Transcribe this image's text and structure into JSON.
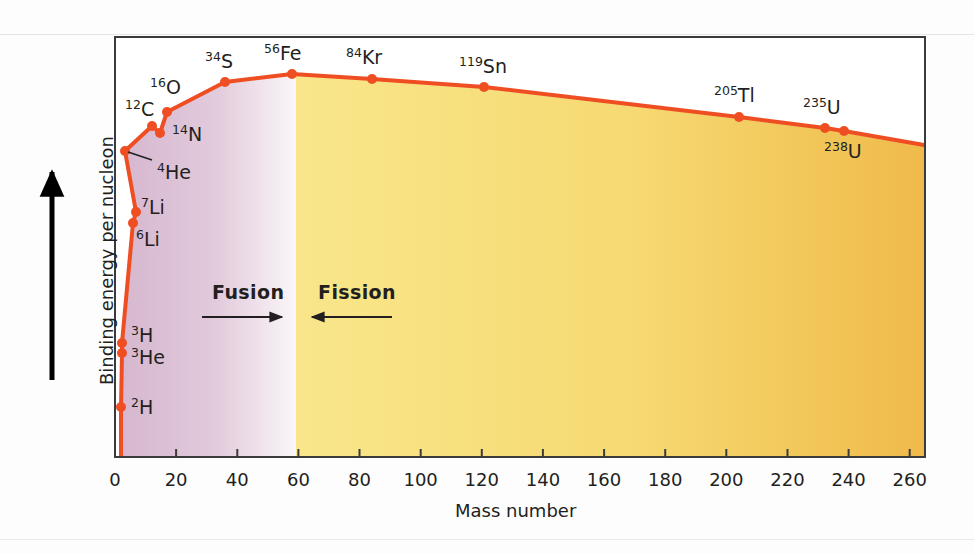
{
  "figure": {
    "kind": "binding-energy-curve",
    "background": "#ffffff"
  },
  "axes": {
    "x_title": "Mass number",
    "y_title": "Binding energy per nucleon",
    "x_ticks": [
      "0",
      "20",
      "40",
      "60",
      "80",
      "100",
      "120",
      "140",
      "160",
      "180",
      "200",
      "220",
      "240",
      "260"
    ],
    "y_ticks": [],
    "x_min": 0,
    "x_max": 265,
    "frame_color": "#3b3b3b"
  },
  "regions": [
    {
      "name": "fusion",
      "label": "Fusion",
      "arrow": "right",
      "fill_start": "#d6b7cf",
      "fill_end": "#f7f2f6",
      "x_from": 0,
      "x_to": 60
    },
    {
      "name": "fission",
      "label": "Fission",
      "arrow": "left",
      "fill_start": "#f9e58a",
      "fill_end": "#f0bd4c",
      "x_from": 60,
      "x_to": 265
    }
  ],
  "style": {
    "curve_color": "#ef4e23",
    "marker_color": "#ef4e23",
    "curve_width": 4,
    "marker_radius": 5,
    "arrow_color": "#231f20"
  },
  "chart_data": {
    "type": "line",
    "title": "",
    "xlabel": "Mass number",
    "ylabel": "Binding energy per nucleon",
    "xlim": [
      0,
      265
    ],
    "ylim": [
      0,
      9.2
    ],
    "grid": false,
    "legend": "none",
    "annotations": [
      "Fusion",
      "Fission"
    ],
    "points": [
      {
        "label": "2H",
        "sup": "2",
        "elem": "H",
        "x": 2,
        "y": 1.11,
        "px": 121,
        "py": 407,
        "show_label": true,
        "label_px": 131,
        "label_py": 398,
        "marker": true
      },
      {
        "label": "3He",
        "sup": "3",
        "elem": "He",
        "x": 3,
        "y": 2.57,
        "px": 122,
        "py": 353,
        "show_label": true,
        "label_px": 131,
        "label_py": 348,
        "marker": true
      },
      {
        "label": "3H",
        "sup": "3",
        "elem": "H",
        "x": 3,
        "y": 2.83,
        "px": 122,
        "py": 343,
        "show_label": true,
        "label_px": 131,
        "label_py": 326,
        "marker": true
      },
      {
        "label": "6Li",
        "sup": "6",
        "elem": "Li",
        "x": 6,
        "y": 5.33,
        "px": 133,
        "py": 223,
        "show_label": true,
        "label_px": 136,
        "label_py": 230,
        "marker": true
      },
      {
        "label": "7Li",
        "sup": "7",
        "elem": "Li",
        "x": 7,
        "y": 5.61,
        "px": 136,
        "py": 212,
        "show_label": true,
        "label_px": 141,
        "label_py": 198,
        "marker": true
      },
      {
        "label": "4He",
        "sup": "4",
        "elem": "He",
        "x": 4,
        "y": 7.07,
        "px": 125,
        "py": 151,
        "show_label": true,
        "label_px": 157,
        "label_py": 163,
        "marker": true
      },
      {
        "label": "12C",
        "sup": "12",
        "elem": "C",
        "x": 12,
        "y": 7.68,
        "px": 152,
        "py": 126,
        "show_label": true,
        "label_px": 125,
        "label_py": 100,
        "marker": true
      },
      {
        "label": "14N",
        "sup": "14",
        "elem": "N",
        "x": 14,
        "y": 7.48,
        "px": 160,
        "py": 133,
        "show_label": true,
        "label_px": 172,
        "label_py": 125,
        "marker": true
      },
      {
        "label": "16O",
        "sup": "16",
        "elem": "O",
        "x": 16,
        "y": 7.98,
        "px": 167,
        "py": 112,
        "show_label": true,
        "label_px": 150,
        "label_py": 78,
        "marker": true
      },
      {
        "label": "34S",
        "sup": "34",
        "elem": "S",
        "x": 34,
        "y": 8.58,
        "px": 225,
        "py": 82,
        "show_label": true,
        "label_px": 205,
        "label_py": 52,
        "marker": true
      },
      {
        "label": "56Fe",
        "sup": "56",
        "elem": "Fe",
        "x": 56,
        "y": 8.79,
        "px": 292,
        "py": 74,
        "show_label": true,
        "label_px": 264,
        "label_py": 44,
        "marker": true
      },
      {
        "label": "84Kr",
        "sup": "84",
        "elem": "Kr",
        "x": 84,
        "y": 8.72,
        "px": 372,
        "py": 79,
        "show_label": true,
        "label_px": 346,
        "label_py": 48,
        "marker": true
      },
      {
        "label": "119Sn",
        "sup": "119",
        "elem": "Sn",
        "x": 119,
        "y": 8.5,
        "px": 484,
        "py": 87,
        "show_label": true,
        "label_px": 459,
        "label_py": 57,
        "marker": true
      },
      {
        "label": "205Tl",
        "sup": "205",
        "elem": "Tl",
        "x": 205,
        "y": 7.88,
        "px": 739,
        "py": 117,
        "show_label": true,
        "label_px": 714,
        "label_py": 86,
        "marker": true
      },
      {
        "label": "235U",
        "sup": "235",
        "elem": "U",
        "x": 234,
        "y": 7.6,
        "px": 825,
        "py": 128,
        "show_label": true,
        "label_px": 803,
        "label_py": 98,
        "marker": true
      },
      {
        "label": "238U",
        "sup": "238",
        "elem": "U",
        "x": 240,
        "y": 7.56,
        "px": 844,
        "py": 131,
        "show_label": true,
        "label_px": 824,
        "label_py": 142,
        "marker": true
      }
    ],
    "endpoint": {
      "x": 265,
      "y": 7.3,
      "px": 924,
      "py": 145
    },
    "origin": {
      "x": 2,
      "y": 0.0,
      "px": 121,
      "py": 457
    }
  }
}
